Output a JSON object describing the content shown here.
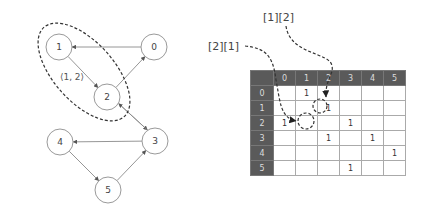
{
  "graph": {
    "nodes": [
      {
        "id": "0",
        "x": 154,
        "y": 47
      },
      {
        "id": "1",
        "x": 59,
        "y": 47
      },
      {
        "id": "2",
        "x": 107,
        "y": 97
      },
      {
        "id": "3",
        "x": 155,
        "y": 141
      },
      {
        "id": "4",
        "x": 60,
        "y": 142
      },
      {
        "id": "5",
        "x": 108,
        "y": 190
      }
    ],
    "edges": [
      [
        "0",
        "1"
      ],
      [
        "1",
        "2"
      ],
      [
        "2",
        "0"
      ],
      [
        "2",
        "3"
      ],
      [
        "3",
        "2"
      ],
      [
        "3",
        "4"
      ],
      [
        "4",
        "5"
      ],
      [
        "5",
        "3"
      ]
    ],
    "highlight_label": "⟨1, 2⟩"
  },
  "matrix": {
    "headers": [
      "0",
      "1",
      "2",
      "3",
      "4",
      "5"
    ],
    "rows": [
      [
        "",
        "1",
        "",
        "",
        "",
        ""
      ],
      [
        "",
        "",
        "1",
        "",
        "",
        ""
      ],
      [
        "1",
        "",
        "",
        "1",
        "",
        ""
      ],
      [
        "",
        "",
        "1",
        "",
        "1",
        ""
      ],
      [
        "",
        "",
        "",
        "",
        "",
        "1"
      ],
      [
        "",
        "",
        "",
        "1",
        "",
        ""
      ]
    ]
  },
  "annotations": {
    "label_12": "[1][2]",
    "label_21": "[2][1]"
  }
}
